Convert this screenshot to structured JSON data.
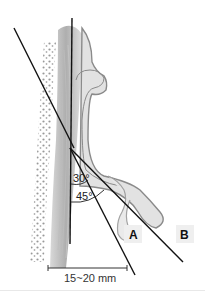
{
  "diagram": {
    "angles": [
      {
        "label": "30°",
        "value": 30
      },
      {
        "label": "45°",
        "value": 45
      }
    ],
    "labels": {
      "a": "A",
      "b": "B"
    },
    "scale": {
      "label": "15~20 mm"
    },
    "colors": {
      "line": "#111111",
      "tissue_fill": "#dcdcdc",
      "tissue_outline": "#8a8a8a",
      "bone_dots": "#9a9a9a",
      "label_bg": "#eeeeee"
    }
  }
}
